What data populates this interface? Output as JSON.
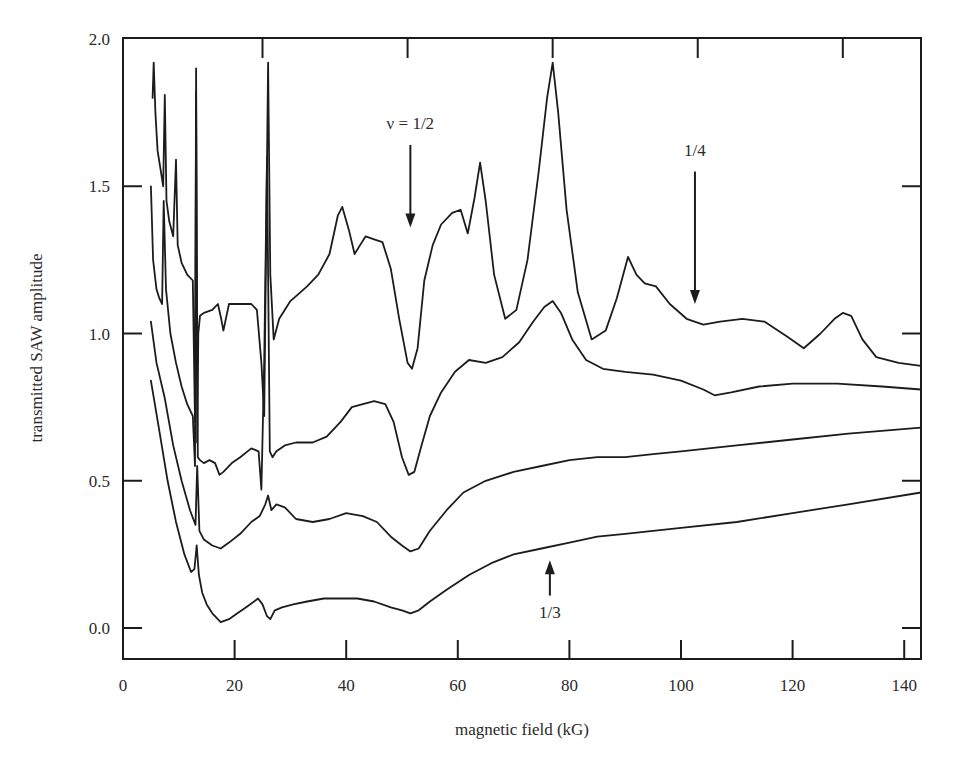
{
  "chart_data": {
    "type": "line",
    "title": "",
    "xlabel": "magnetic field (kG)",
    "ylabel": "transmitted SAW amplitude",
    "xlim": [
      0,
      143
    ],
    "ylim": [
      -0.105,
      2.0
    ],
    "grid": false,
    "legend": null,
    "x_ticks": [
      0,
      20,
      40,
      60,
      80,
      100,
      120,
      140
    ],
    "x_tick_labels": [
      "0",
      "20",
      "40",
      "60",
      "80",
      "100",
      "120",
      "140"
    ],
    "y_ticks": [
      0.0,
      0.5,
      1.0,
      1.5,
      2.0
    ],
    "y_tick_labels": [
      "0.0",
      "0.5",
      "1.0",
      "1.5",
      "2.0"
    ],
    "top_ticks": [
      25,
      51,
      77,
      103,
      129
    ],
    "series": [
      {
        "name": "trace 1 (top)",
        "x": [
          5.3,
          5.5,
          5.8,
          6.2,
          6.8,
          7.2,
          7.5,
          7.8,
          8.3,
          9.0,
          9.5,
          9.8,
          10.5,
          11.5,
          12.5,
          12.9,
          13.1,
          13.3,
          13.5,
          13.8,
          14.5,
          16.0,
          17.0,
          17.6,
          18.0,
          19.0,
          21.0,
          23.0,
          24.0,
          24.8,
          25.3,
          25.7,
          26.0,
          26.4,
          27.0,
          28.0,
          30.0,
          33.0,
          35.0,
          37.0,
          38.5,
          39.3,
          40.5,
          41.5,
          42.5,
          43.5,
          45.0,
          46.5,
          48.0,
          49.5,
          51.0,
          51.8,
          52.8,
          54.0,
          55.5,
          57.0,
          59.0,
          60.5,
          61.8,
          63.0,
          64.0,
          65.0,
          66.5,
          68.5,
          70.5,
          72.5,
          74.5,
          76.0,
          77.0,
          78.0,
          79.5,
          81.5,
          84.0,
          86.5,
          88.5,
          90.5,
          92.0,
          93.5,
          95.5,
          98.0,
          101.0,
          104.0,
          107.0,
          111.0,
          115.0,
          119.0,
          122.0,
          125.0,
          127.5,
          129.0,
          130.5,
          132.5,
          135.0,
          139.0,
          143.0
        ],
        "y": [
          1.8,
          1.92,
          1.75,
          1.62,
          1.55,
          1.5,
          1.81,
          1.45,
          1.38,
          1.33,
          1.59,
          1.3,
          1.24,
          1.2,
          1.18,
          0.7,
          1.9,
          0.63,
          1.0,
          1.06,
          1.07,
          1.08,
          1.1,
          1.05,
          1.01,
          1.1,
          1.1,
          1.1,
          1.08,
          0.9,
          0.72,
          1.4,
          1.92,
          1.2,
          0.98,
          1.05,
          1.11,
          1.16,
          1.2,
          1.27,
          1.4,
          1.43,
          1.35,
          1.27,
          1.3,
          1.33,
          1.32,
          1.31,
          1.22,
          1.05,
          0.9,
          0.88,
          0.95,
          1.18,
          1.3,
          1.37,
          1.41,
          1.42,
          1.34,
          1.46,
          1.58,
          1.45,
          1.2,
          1.05,
          1.08,
          1.25,
          1.55,
          1.8,
          1.92,
          1.75,
          1.42,
          1.14,
          0.98,
          1.01,
          1.12,
          1.26,
          1.2,
          1.17,
          1.16,
          1.1,
          1.05,
          1.03,
          1.04,
          1.05,
          1.04,
          0.99,
          0.95,
          1.0,
          1.05,
          1.07,
          1.06,
          0.98,
          0.92,
          0.9,
          0.89
        ]
      },
      {
        "name": "trace 2",
        "x": [
          5.0,
          5.4,
          6.0,
          6.5,
          7.0,
          7.3,
          7.7,
          8.5,
          9.5,
          10.5,
          11.5,
          12.5,
          12.9,
          13.1,
          13.4,
          13.8,
          14.5,
          15.5,
          16.5,
          17.3,
          18.0,
          19.5,
          21.0,
          23.0,
          24.3,
          24.8,
          25.3,
          25.8,
          26.3,
          26.8,
          27.5,
          29.0,
          31.0,
          34.0,
          36.5,
          39.0,
          41.0,
          43.0,
          45.0,
          47.0,
          48.5,
          50.0,
          51.2,
          52.2,
          53.5,
          55.0,
          57.0,
          59.5,
          62.0,
          65.0,
          68.0,
          71.0,
          73.5,
          75.5,
          77.0,
          78.5,
          80.5,
          83.0,
          86.0,
          90.0,
          95.0,
          100.0,
          104.0,
          106.0,
          109.0,
          114.0,
          120.0,
          128.0,
          136.0,
          143.0
        ],
        "y": [
          1.5,
          1.25,
          1.15,
          1.12,
          1.1,
          1.45,
          1.15,
          1.0,
          0.9,
          0.82,
          0.76,
          0.72,
          0.55,
          1.82,
          0.58,
          0.57,
          0.56,
          0.57,
          0.56,
          0.52,
          0.53,
          0.56,
          0.58,
          0.61,
          0.6,
          0.47,
          0.9,
          1.6,
          0.6,
          0.58,
          0.6,
          0.62,
          0.63,
          0.63,
          0.65,
          0.7,
          0.75,
          0.76,
          0.77,
          0.76,
          0.7,
          0.58,
          0.52,
          0.53,
          0.62,
          0.72,
          0.8,
          0.87,
          0.91,
          0.9,
          0.92,
          0.97,
          1.04,
          1.09,
          1.11,
          1.07,
          0.98,
          0.91,
          0.88,
          0.87,
          0.86,
          0.84,
          0.81,
          0.79,
          0.8,
          0.82,
          0.83,
          0.83,
          0.82,
          0.81
        ]
      },
      {
        "name": "trace 3",
        "x": [
          5.0,
          6.0,
          7.5,
          9.0,
          10.5,
          12.0,
          13.0,
          13.3,
          13.7,
          14.5,
          16.0,
          17.5,
          19.0,
          21.0,
          23.0,
          24.5,
          25.5,
          26.0,
          26.6,
          27.5,
          29.0,
          31.0,
          34.0,
          37.0,
          40.0,
          43.0,
          45.5,
          48.0,
          50.0,
          51.5,
          53.0,
          55.0,
          58.0,
          61.0,
          65.0,
          70.0,
          75.0,
          80.0,
          85.0,
          90.0,
          95.0,
          100.0,
          110.0,
          120.0,
          130.0,
          143.0
        ],
        "y": [
          1.04,
          0.9,
          0.78,
          0.62,
          0.5,
          0.4,
          0.35,
          0.55,
          0.33,
          0.3,
          0.28,
          0.27,
          0.29,
          0.32,
          0.36,
          0.38,
          0.42,
          0.45,
          0.4,
          0.42,
          0.41,
          0.37,
          0.36,
          0.37,
          0.39,
          0.38,
          0.36,
          0.31,
          0.28,
          0.26,
          0.27,
          0.33,
          0.4,
          0.46,
          0.5,
          0.53,
          0.55,
          0.57,
          0.58,
          0.58,
          0.59,
          0.6,
          0.62,
          0.64,
          0.66,
          0.68
        ]
      },
      {
        "name": "trace 4 (bottom)",
        "x": [
          5.0,
          6.5,
          8.0,
          9.5,
          11.0,
          12.2,
          12.8,
          13.2,
          13.6,
          14.2,
          15.0,
          16.0,
          17.5,
          19.0,
          20.5,
          22.0,
          23.5,
          24.2,
          25.0,
          25.8,
          26.4,
          27.2,
          28.5,
          30.5,
          33.0,
          36.0,
          39.0,
          42.0,
          45.0,
          48.0,
          50.0,
          51.5,
          53.0,
          55.0,
          58.0,
          62.0,
          66.0,
          70.0,
          75.0,
          80.0,
          85.0,
          90.0,
          95.0,
          100.0,
          110.0,
          120.0,
          130.0,
          143.0
        ],
        "y": [
          0.84,
          0.67,
          0.5,
          0.36,
          0.25,
          0.19,
          0.2,
          0.28,
          0.18,
          0.12,
          0.08,
          0.05,
          0.02,
          0.03,
          0.05,
          0.07,
          0.09,
          0.1,
          0.08,
          0.04,
          0.03,
          0.06,
          0.07,
          0.08,
          0.09,
          0.1,
          0.1,
          0.1,
          0.09,
          0.07,
          0.06,
          0.05,
          0.06,
          0.09,
          0.13,
          0.18,
          0.22,
          0.25,
          0.27,
          0.29,
          0.31,
          0.32,
          0.33,
          0.34,
          0.36,
          0.39,
          0.42,
          0.46
        ]
      }
    ],
    "annotations": [
      {
        "text": "ν = 1/2",
        "x": 51.5,
        "arrow_from": 1.64,
        "arrow_to": 1.36,
        "direction": "down"
      },
      {
        "text": "1/4",
        "x": 102.5,
        "arrow_from": 1.55,
        "arrow_to": 1.1,
        "direction": "down"
      },
      {
        "text": "1/3",
        "x": 76.5,
        "arrow_from": 0.11,
        "arrow_to": 0.23,
        "direction": "up"
      }
    ]
  },
  "labels": {
    "xlabel": "magnetic field (kG)",
    "ylabel": "transmitted SAW amplitude",
    "annot_half": "ν = 1/2",
    "annot_quarter": "1/4",
    "annot_third": "1/3"
  },
  "style": {
    "line_color": "#1c1c1c",
    "background": "#ffffff"
  }
}
